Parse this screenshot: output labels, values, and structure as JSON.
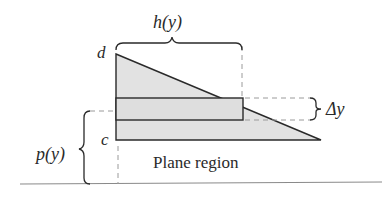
{
  "diagram": {
    "labels": {
      "top_brace": "h(y)",
      "top_vertex": "d",
      "bottom_vertex": "c",
      "strip_height": "Δy",
      "left_brace": "p(y)",
      "region": "Plane region"
    },
    "colors": {
      "fill": "#e2e2e2",
      "stroke": "#2a2a2a",
      "dashed": "#9a9a9a",
      "ground": "#8a8a8a"
    }
  }
}
